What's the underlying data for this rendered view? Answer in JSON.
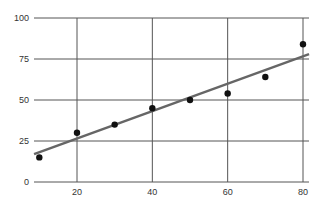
{
  "chart_data": {
    "type": "scatter",
    "title": "",
    "xlabel": "",
    "ylabel": "",
    "xlim": [
      8.5,
      82
    ],
    "ylim": [
      0,
      100
    ],
    "grid": true,
    "legend": null,
    "x_ticks": [
      20,
      40,
      60,
      80
    ],
    "y_ticks": [
      0,
      25,
      50,
      75,
      100
    ],
    "series": [
      {
        "name": "points",
        "kind": "scatter",
        "color": "#111111",
        "x": [
          10,
          20,
          30,
          40,
          50,
          60,
          70,
          80
        ],
        "y": [
          15,
          30,
          35,
          45,
          50,
          54,
          64,
          84
        ]
      },
      {
        "name": "trend line",
        "kind": "line",
        "color": "#666666",
        "x": [
          8.6,
          81.6
        ],
        "y": [
          17,
          78
        ]
      }
    ]
  },
  "colors": {
    "grid": "#555555",
    "points": "#111111",
    "trend": "#666666",
    "tick_text": "#333333"
  }
}
